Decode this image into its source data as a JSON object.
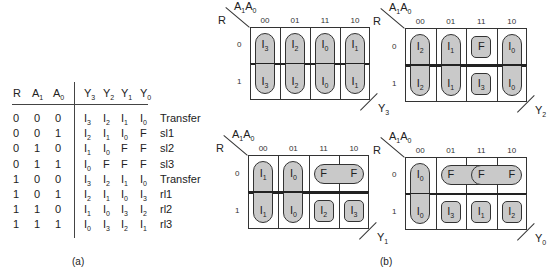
{
  "truth_table": {
    "headers": {
      "R": "R",
      "A1": {
        "base": "A",
        "sub": "1"
      },
      "A0": {
        "base": "A",
        "sub": "0"
      },
      "Y3": {
        "base": "Y",
        "sub": "3"
      },
      "Y2": {
        "base": "Y",
        "sub": "2"
      },
      "Y1": {
        "base": "Y",
        "sub": "1"
      },
      "Y0": {
        "base": "Y",
        "sub": "0"
      }
    },
    "rows": [
      {
        "R": "0",
        "A1": "0",
        "A0": "0",
        "Y": [
          [
            "I",
            "3"
          ],
          [
            "I",
            "2"
          ],
          [
            "I",
            "1"
          ],
          [
            "I",
            "0"
          ]
        ],
        "op": "Transfer"
      },
      {
        "R": "0",
        "A1": "0",
        "A0": "1",
        "Y": [
          [
            "I",
            "2"
          ],
          [
            "I",
            "1"
          ],
          [
            "I",
            "0"
          ],
          [
            "F",
            ""
          ]
        ],
        "op": "sl1"
      },
      {
        "R": "0",
        "A1": "1",
        "A0": "0",
        "Y": [
          [
            "I",
            "1"
          ],
          [
            "I",
            "0"
          ],
          [
            "F",
            ""
          ],
          [
            "F",
            ""
          ]
        ],
        "op": "sl2"
      },
      {
        "R": "0",
        "A1": "1",
        "A0": "1",
        "Y": [
          [
            "I",
            "0"
          ],
          [
            "F",
            ""
          ],
          [
            "F",
            ""
          ],
          [
            "F",
            ""
          ]
        ],
        "op": "sl3"
      },
      {
        "R": "1",
        "A1": "0",
        "A0": "0",
        "Y": [
          [
            "I",
            "3"
          ],
          [
            "I",
            "2"
          ],
          [
            "I",
            "1"
          ],
          [
            "I",
            "0"
          ]
        ],
        "op": "Transfer"
      },
      {
        "R": "1",
        "A1": "0",
        "A0": "1",
        "Y": [
          [
            "I",
            "2"
          ],
          [
            "I",
            "1"
          ],
          [
            "I",
            "0"
          ],
          [
            "I",
            "3"
          ]
        ],
        "op": "rl1"
      },
      {
        "R": "1",
        "A1": "1",
        "A0": "0",
        "Y": [
          [
            "I",
            "1"
          ],
          [
            "I",
            "0"
          ],
          [
            "I",
            "3"
          ],
          [
            "I",
            "2"
          ]
        ],
        "op": "rl2"
      },
      {
        "R": "1",
        "A1": "1",
        "A0": "1",
        "Y": [
          [
            "I",
            "0"
          ],
          [
            "I",
            "3"
          ],
          [
            "I",
            "2"
          ],
          [
            "I",
            "1"
          ]
        ],
        "op": "rl3"
      }
    ],
    "caption": "(a)"
  },
  "kmaps": {
    "col_headers": [
      "00",
      "01",
      "11",
      "10"
    ],
    "row_headers": [
      "0",
      "1"
    ],
    "corner": {
      "row_var": "R",
      "col_var_1": {
        "base": "A",
        "sub": "1"
      },
      "col_var_0": {
        "base": "A",
        "sub": "0"
      }
    },
    "maps": [
      {
        "output": {
          "base": "Y",
          "sub": "3"
        },
        "x": 250,
        "y": 27,
        "w": 120,
        "h": 73,
        "cells": [
          [
            [
              "I",
              "3"
            ],
            [
              "I",
              "2"
            ],
            [
              "I",
              "0"
            ],
            [
              "I",
              "1"
            ]
          ],
          [
            [
              "I",
              "3"
            ],
            [
              "I",
              "2"
            ],
            [
              "I",
              "0"
            ],
            [
              "I",
              "1"
            ]
          ]
        ],
        "groups": [
          {
            "type": "v",
            "col": 0
          },
          {
            "type": "v",
            "col": 1
          },
          {
            "type": "v",
            "col": 2
          },
          {
            "type": "v",
            "col": 3
          }
        ]
      },
      {
        "output": {
          "base": "Y",
          "sub": "2"
        },
        "x": 405,
        "y": 28,
        "w": 122,
        "h": 74,
        "cells": [
          [
            [
              "I",
              "2"
            ],
            [
              "I",
              "1"
            ],
            [
              "F",
              ""
            ],
            [
              "I",
              "0"
            ]
          ],
          [
            [
              "I",
              "2"
            ],
            [
              "I",
              "1"
            ],
            [
              "I",
              "3"
            ],
            [
              "I",
              "0"
            ]
          ]
        ],
        "groups": [
          {
            "type": "v",
            "col": 0
          },
          {
            "type": "v",
            "col": 1
          },
          {
            "type": "s",
            "row": 0,
            "col": 2
          },
          {
            "type": "s",
            "row": 1,
            "col": 2
          },
          {
            "type": "v",
            "col": 3
          }
        ]
      },
      {
        "output": {
          "base": "Y",
          "sub": "1"
        },
        "x": 248,
        "y": 155,
        "w": 121,
        "h": 74,
        "cells": [
          [
            [
              "I",
              "1"
            ],
            [
              "I",
              "0"
            ],
            [
              "F",
              ""
            ],
            [
              "F",
              ""
            ]
          ],
          [
            [
              "I",
              "1"
            ],
            [
              "I",
              "0"
            ],
            [
              "I",
              "2"
            ],
            [
              "I",
              "3"
            ]
          ]
        ],
        "groups": [
          {
            "type": "v",
            "col": 0
          },
          {
            "type": "v",
            "col": 1
          },
          {
            "type": "h",
            "row": 0,
            "col": 2,
            "span": 2
          },
          {
            "type": "s",
            "row": 1,
            "col": 2
          },
          {
            "type": "s",
            "row": 1,
            "col": 3
          }
        ]
      },
      {
        "output": {
          "base": "Y",
          "sub": "0"
        },
        "x": 405,
        "y": 157,
        "w": 122,
        "h": 73,
        "cells": [
          [
            [
              "I",
              "0"
            ],
            [
              "F",
              ""
            ],
            [
              "F",
              ""
            ],
            [
              "F",
              ""
            ]
          ],
          [
            [
              "I",
              "0"
            ],
            [
              "I",
              "3"
            ],
            [
              "I",
              "1"
            ],
            [
              "I",
              "2"
            ]
          ]
        ],
        "groups": [
          {
            "type": "v",
            "col": 0
          },
          {
            "type": "h",
            "row": 0,
            "col": 1,
            "span": 2
          },
          {
            "type": "h",
            "row": 0,
            "col": 2,
            "span": 2
          },
          {
            "type": "s",
            "row": 1,
            "col": 1
          },
          {
            "type": "s",
            "row": 1,
            "col": 2
          },
          {
            "type": "s",
            "row": 1,
            "col": 3
          }
        ]
      }
    ],
    "caption": "(b)"
  }
}
